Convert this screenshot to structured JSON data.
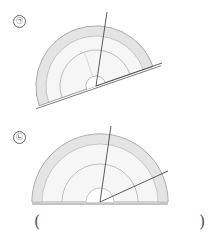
{
  "problems": [
    {
      "label": "㉠",
      "ray_angle_deg": 20,
      "baseline_tilt_deg": -19
    },
    {
      "label": "㉡",
      "ray_angle_deg": 25,
      "baseline_tilt_deg": 0
    }
  ],
  "answer": {
    "open": "(",
    "close": ")"
  },
  "colors": {
    "stroke": "#555555",
    "band": "#e0e0e0"
  }
}
